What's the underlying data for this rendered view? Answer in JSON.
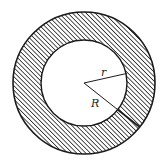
{
  "diagram": {
    "type": "annulus",
    "outer_circle": {
      "cx": 84,
      "cy": 83,
      "radius": 71,
      "label": "R"
    },
    "inner_circle": {
      "cx": 84,
      "cy": 83,
      "radius": 43,
      "label": "r"
    },
    "labels": {
      "inner_radius": "r",
      "outer_radius": "R"
    },
    "fill": {
      "pattern": "diagonal-hatch",
      "color": "#1a1a1a",
      "background": "#ffffff"
    },
    "stroke_color": "#1a1a1a"
  }
}
